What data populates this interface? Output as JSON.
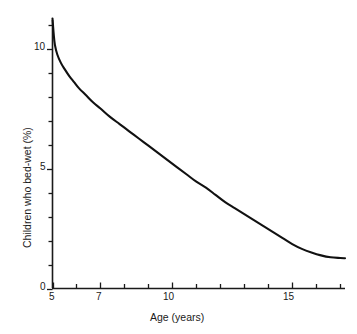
{
  "chart_data": {
    "type": "line",
    "title": "",
    "xlabel": "Age (years)",
    "ylabel": "Children who bed-wet (%)",
    "xlim": [
      5,
      17.2
    ],
    "ylim": [
      0,
      11.5
    ],
    "grid": false,
    "legend": "none",
    "x_tick_values": [
      5,
      6,
      7,
      8,
      9,
      10,
      11,
      12,
      13,
      14,
      15,
      16,
      17
    ],
    "x_tick_labels": [
      "5",
      "",
      "7",
      "",
      "",
      "10",
      "",
      "",
      "",
      "",
      "15",
      "",
      ""
    ],
    "x_labeled_ticks": [
      {
        "value": 5,
        "label": "5"
      },
      {
        "value": 7,
        "label": "7"
      },
      {
        "value": 10,
        "label": "10"
      },
      {
        "value": 15,
        "label": "15"
      }
    ],
    "y_tick_values": [
      0,
      1,
      2,
      3,
      4,
      5,
      6,
      7,
      8,
      9,
      10,
      11
    ],
    "y_labeled_ticks": [
      {
        "value": 0,
        "label": "0"
      },
      {
        "value": 5,
        "label": "5"
      },
      {
        "value": 10,
        "label": "10"
      }
    ],
    "series": [
      {
        "name": "Children who bed-wet",
        "color": "#111111",
        "line_width": 2.1,
        "x": [
          5.0,
          5.05,
          5.1,
          5.2,
          5.35,
          5.5,
          5.7,
          5.9,
          6.1,
          6.4,
          6.7,
          7.0,
          7.4,
          7.8,
          8.2,
          8.6,
          9.0,
          9.4,
          9.8,
          10.2,
          10.6,
          11.0,
          11.4,
          11.8,
          12.2,
          12.6,
          13.0,
          13.4,
          13.8,
          14.2,
          14.6,
          15.0,
          15.4,
          15.8,
          16.2,
          16.6,
          17.0,
          17.2
        ],
        "y": [
          11.25,
          10.6,
          10.15,
          9.75,
          9.4,
          9.15,
          8.85,
          8.6,
          8.35,
          8.05,
          7.75,
          7.5,
          7.15,
          6.85,
          6.55,
          6.25,
          5.95,
          5.65,
          5.35,
          5.05,
          4.75,
          4.45,
          4.2,
          3.9,
          3.6,
          3.35,
          3.1,
          2.85,
          2.6,
          2.35,
          2.1,
          1.85,
          1.65,
          1.5,
          1.38,
          1.3,
          1.27,
          1.26
        ]
      }
    ]
  },
  "axes": {
    "x_axis_name": "age-axis",
    "y_axis_name": "percent-axis"
  },
  "colors": {
    "line": "#111111",
    "axis": "#1a1a1a",
    "background": "#ffffff",
    "text": "#1a1a1a"
  },
  "labels": {
    "y_axis_title": "Children who bed-wet (%)",
    "x_axis_title": "Age (years)",
    "y_tick_0": "0",
    "y_tick_5": "5",
    "y_tick_10": "10",
    "x_tick_5": "5",
    "x_tick_7": "7",
    "x_tick_10": "10",
    "x_tick_15": "15"
  }
}
